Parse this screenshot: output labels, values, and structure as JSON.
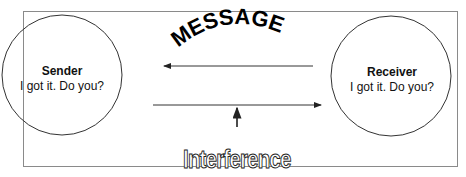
{
  "diagram": {
    "type": "communication-model",
    "message_label": "MESSAGE",
    "interference_label": "Interference",
    "sender": {
      "title": "Sender",
      "text": "I got it. Do you?"
    },
    "receiver": {
      "title": "Receiver",
      "text": "I got it.  Do you?"
    },
    "edges": [
      {
        "from": "receiver",
        "to": "sender",
        "label": "MESSAGE"
      },
      {
        "from": "sender",
        "to": "receiver",
        "label": ""
      },
      {
        "from": "interference",
        "to": "sender-receiver-channel",
        "label": "Interference"
      }
    ],
    "colors": {
      "line": "#333333",
      "frame": "#8a8a8a",
      "text": "#111111"
    }
  }
}
